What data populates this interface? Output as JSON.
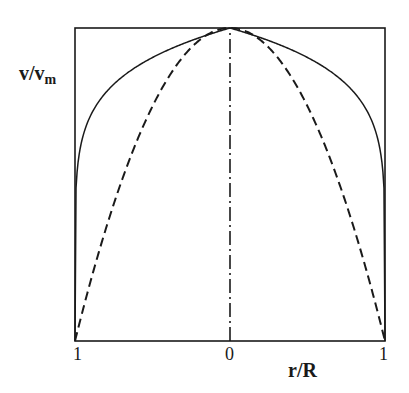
{
  "chart_data": {
    "type": "line",
    "title": "",
    "xlabel": "r/R",
    "ylabel": "v/v_m",
    "ylabel_main": "v/v",
    "ylabel_sub": "m",
    "x_ticks": [
      "1",
      "0",
      "1"
    ],
    "x_tick_positions": [
      -1,
      0,
      1
    ],
    "xlim": [
      -1,
      1
    ],
    "ylim": [
      0,
      1
    ],
    "grid": false,
    "legend": null,
    "series": [
      {
        "name": "turbulent profile (power law ~1/7)",
        "style": "solid",
        "function": "v/vm = (1 - |r/R|)^(1/7)",
        "exponent": 0.1429,
        "x": [
          -1,
          -0.99,
          -0.95,
          -0.9,
          -0.8,
          -0.6,
          -0.4,
          -0.2,
          0,
          0.2,
          0.4,
          0.6,
          0.8,
          0.9,
          0.95,
          0.99,
          1
        ],
        "y": [
          0,
          0.52,
          0.65,
          0.72,
          0.79,
          0.88,
          0.93,
          0.97,
          1.0,
          0.97,
          0.93,
          0.88,
          0.79,
          0.72,
          0.65,
          0.52,
          0
        ]
      },
      {
        "name": "laminar profile (parabolic)",
        "style": "dashed",
        "function": "v/vm = 1 - (r/R)^2",
        "x": [
          -1,
          -0.8,
          -0.6,
          -0.4,
          -0.2,
          0,
          0.2,
          0.4,
          0.6,
          0.8,
          1
        ],
        "y": [
          0,
          0.36,
          0.64,
          0.84,
          0.96,
          1.0,
          0.96,
          0.84,
          0.64,
          0.36,
          0
        ]
      },
      {
        "name": "centerline",
        "style": "dash-dot",
        "x": [
          0,
          0
        ],
        "y": [
          0,
          1
        ]
      }
    ],
    "plot_box": {
      "left": 75,
      "top": 28,
      "right": 385,
      "bottom": 341
    },
    "colors": {
      "line": "#1a1a1a",
      "background": "#ffffff"
    }
  }
}
